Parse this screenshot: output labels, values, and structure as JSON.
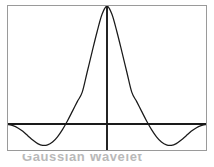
{
  "figure": {
    "background_color": "#ffffff",
    "frame_color": "#9a9a9a",
    "curve_color": "#1a1a1a",
    "axis_color": "#1a1a1a",
    "caption": "Gaussian Wavelet"
  },
  "chart_data": {
    "type": "line",
    "title": "",
    "subtitle": "",
    "xlabel": "",
    "ylabel": "",
    "grid": false,
    "legend": null,
    "xlim": [
      -4,
      4
    ],
    "ylim": [
      -0.22,
      1.0
    ],
    "annotations": [
      "central positive peak touching top of frame",
      "two symmetric negative side lobes below the horizontal axis",
      "vertical axis drawn through the peak",
      "horizontal axis drawn at y = 0"
    ],
    "series": [
      {
        "name": "wavelet",
        "x": [
          -4.0,
          -3.8,
          -3.6,
          -3.4,
          -3.2,
          -3.0,
          -2.8,
          -2.6,
          -2.4,
          -2.2,
          -2.0,
          -1.8,
          -1.6,
          -1.4,
          -1.2,
          -1.0,
          -0.8,
          -0.6,
          -0.4,
          -0.2,
          0.0,
          0.2,
          0.4,
          0.6,
          0.8,
          1.0,
          1.2,
          1.4,
          1.6,
          1.8,
          2.0,
          2.2,
          2.4,
          2.6,
          2.8,
          3.0,
          3.2,
          3.4,
          3.6,
          3.8,
          4.0
        ],
        "values": [
          -0.004,
          -0.014,
          -0.033,
          -0.062,
          -0.099,
          -0.136,
          -0.166,
          -0.181,
          -0.177,
          -0.152,
          -0.108,
          -0.047,
          0.026,
          0.107,
          0.19,
          0.27,
          0.441,
          0.614,
          0.782,
          0.93,
          1.0,
          0.93,
          0.782,
          0.614,
          0.441,
          0.27,
          0.19,
          0.107,
          0.026,
          -0.047,
          -0.108,
          -0.152,
          -0.177,
          -0.181,
          -0.166,
          -0.136,
          -0.099,
          -0.062,
          -0.033,
          -0.014,
          -0.004
        ]
      }
    ],
    "axes": {
      "x_axis_y_value": 0,
      "y_axis_x_value": 0
    }
  }
}
